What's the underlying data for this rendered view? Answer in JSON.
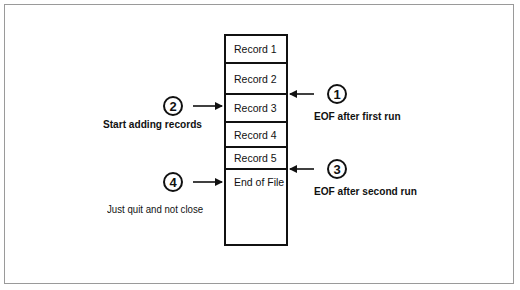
{
  "diagram": {
    "type": "file-record-layout",
    "records": [
      {
        "label": "Record 1"
      },
      {
        "label": "Record 2"
      },
      {
        "label": "Record 3"
      },
      {
        "label": "Record 4"
      },
      {
        "label": "Record 5"
      },
      {
        "label": "End of File"
      }
    ],
    "annotations": [
      {
        "number": "1",
        "text": "EOF after first run",
        "side": "right",
        "points_to": "boundary between Record 2 and Record 3"
      },
      {
        "number": "2",
        "text": "Start adding records",
        "side": "left",
        "points_to": "Record 3"
      },
      {
        "number": "3",
        "text": "EOF after second run",
        "side": "right",
        "points_to": "boundary between Record 5 and End of File"
      },
      {
        "number": "4",
        "text": "Just quit  and not close",
        "side": "left",
        "points_to": "End of File"
      }
    ]
  }
}
